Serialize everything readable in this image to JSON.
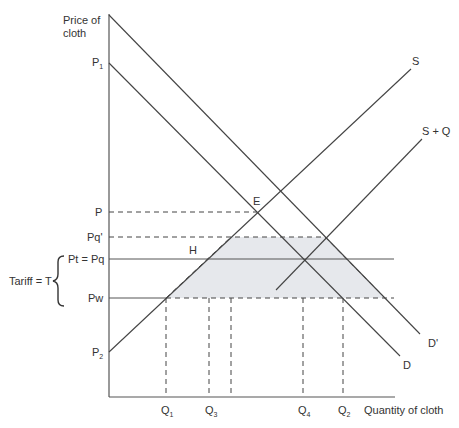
{
  "diagram": {
    "y_axis_label_line1": "Price of",
    "y_axis_label_line2": "cloth",
    "x_axis_label": "Quantity of cloth",
    "price_labels": {
      "P1": {
        "main": "P",
        "sub": "1"
      },
      "P": "P",
      "Pq_prime": "Pq'",
      "Pt": "Pt = Pq",
      "Pw": "Pw",
      "P2": {
        "main": "P",
        "sub": "2"
      }
    },
    "tariff_label": "Tariff = T",
    "quantity_labels": {
      "Q1": {
        "main": "Q",
        "sub": "1"
      },
      "Q3": {
        "main": "Q",
        "sub": "3"
      },
      "Q4": {
        "main": "Q",
        "sub": "4"
      },
      "Q2": {
        "main": "Q",
        "sub": "2"
      }
    },
    "curve_labels": {
      "S": "S",
      "S_plus_Q": "S + Q",
      "D": "D",
      "D_prime": "D'",
      "E": "E",
      "H": "H"
    },
    "colors": {
      "line": "#444444",
      "shade": "#e6e8ec",
      "text": "#333333"
    }
  }
}
